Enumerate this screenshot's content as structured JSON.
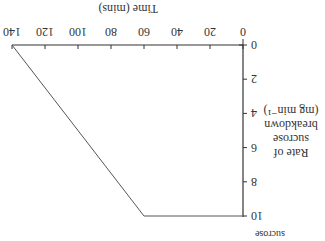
{
  "chart_data": {
    "type": "line",
    "title": "",
    "xlabel": "Time (mins)",
    "ylabel": [
      "Rate of",
      "sucrose",
      "breakdown",
      "(mg min⁻¹)"
    ],
    "x_ticks": [
      "0",
      "20",
      "40",
      "60",
      "80",
      "100",
      "120",
      "140"
    ],
    "y_ticks": [
      "0",
      "2",
      "4",
      "6",
      "8",
      "10"
    ],
    "xlim": [
      0,
      140
    ],
    "ylim": [
      0,
      10
    ],
    "grid": false,
    "orientation_note": "image displayed rotated 180°",
    "series": [
      {
        "name": "rate",
        "x": [
          0,
          60,
          140
        ],
        "y": [
          10,
          10,
          0
        ]
      }
    ],
    "clipped_label": "sucrose"
  }
}
